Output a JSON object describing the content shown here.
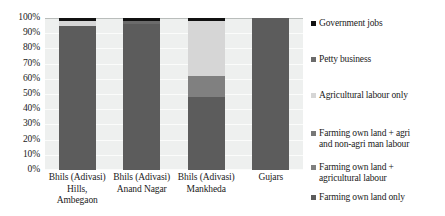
{
  "chart_data": {
    "type": "bar",
    "stacked": true,
    "percent_stacked": true,
    "title": "",
    "subtitle": "",
    "xlabel": "",
    "ylabel": "",
    "ylim": [
      0,
      100
    ],
    "grid": true,
    "legend_position": "right",
    "y_ticks": [
      "100%",
      "90%",
      "80%",
      "70%",
      "60%",
      "50%",
      "40%",
      "30%",
      "20%",
      "10%",
      "0%"
    ],
    "y_tick_values": [
      100,
      90,
      80,
      70,
      60,
      50,
      40,
      30,
      20,
      10,
      0
    ],
    "categories": [
      "Bhils (Adivasi)\nHills,\nAmbegaon",
      "Bhils (Adivasi)\nAnand Nagar",
      "Bhils  (Adivasi)\nMankheda",
      "Gujars"
    ],
    "series": [
      {
        "name": "Farming own land only",
        "color": "#5c5c5c",
        "values": [
          95,
          96,
          48,
          100
        ]
      },
      {
        "name": "Farming own land +\nagricultural labour",
        "color": "#808080",
        "values": [
          0,
          0,
          14,
          0
        ]
      },
      {
        "name": "Farming own land + agri\nand non-agri man labour",
        "color": "#6e6e6e",
        "values": [
          0,
          0,
          0,
          0
        ]
      },
      {
        "name": "Agricultural labour only",
        "color": "#d6d6d6",
        "values": [
          3,
          0,
          36,
          0
        ]
      },
      {
        "name": "Petty business",
        "color": "#6b6b6b",
        "values": [
          0,
          2,
          0,
          0
        ]
      },
      {
        "name": "Government jobs",
        "color": "#111111",
        "values": [
          2,
          2,
          2,
          0
        ]
      }
    ],
    "legend_entries": [
      {
        "label": "Government jobs",
        "color": "#111111"
      },
      {
        "label": "Petty business",
        "color": "#6b6b6b"
      },
      {
        "label": "Agricultural labour only",
        "color": "#d6d6d6"
      },
      {
        "label": "Farming own land + agri\nand non-agri man labour",
        "color": "#777777"
      },
      {
        "label": "Farming own land +\nagricultural labour",
        "color": "#808080"
      },
      {
        "label": "Farming own land only",
        "color": "#5c5c5c"
      }
    ],
    "plot_background": "#eef0ef",
    "gridline_color": "#fbfcfb"
  }
}
